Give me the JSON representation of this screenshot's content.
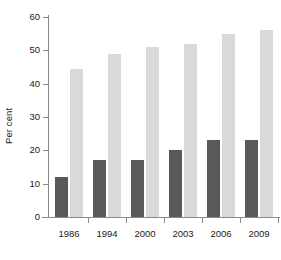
{
  "chart_data": {
    "type": "bar",
    "title": "",
    "subtitle": "",
    "xlabel": "",
    "ylabel": "Per cent",
    "categories": [
      "1986",
      "1994",
      "2000",
      "2003",
      "2006",
      "2009"
    ],
    "series": [
      {
        "name": "series-1-dark",
        "color": "#595959",
        "values": [
          12,
          17,
          17,
          20,
          23,
          23
        ]
      },
      {
        "name": "series-2-light",
        "color": "#d9d9d9",
        "values": [
          44.5,
          49,
          51,
          52,
          55,
          56
        ]
      }
    ],
    "ylim": [
      0,
      60
    ],
    "ytick_labels": [
      "0",
      "10",
      "20",
      "30",
      "40",
      "50",
      "60"
    ],
    "ytick_values": [
      0,
      10,
      20,
      30,
      40,
      50,
      60
    ],
    "grid": false,
    "legend": "none",
    "annotations": []
  },
  "colors": {
    "dark_bar": "#595959",
    "light_bar": "#d9d9d9",
    "axis": "#8a8a8a",
    "text": "#1a1a1a",
    "background": "#ffffff"
  }
}
